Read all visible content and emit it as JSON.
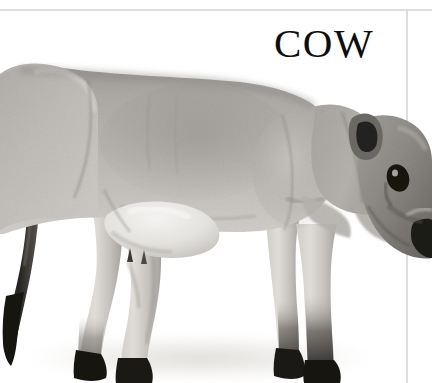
{
  "page": {
    "background_color": "#ffffff",
    "width": 432,
    "height": 383
  },
  "frame": {
    "rule_color": "#dedede",
    "top_rule_y": 9,
    "right_rule_x": 406
  },
  "caption": {
    "text": "COW",
    "color": "#0e0e0e",
    "align": "right"
  },
  "figure": {
    "subject": "cow",
    "alt_text": "COW",
    "style": "grayscale-photograph",
    "orientation": "profile-facing-right",
    "cropped_edges": [
      "left",
      "right",
      "bottom"
    ],
    "palette": {
      "coat_light": "#d8d6d2",
      "coat_mid": "#a9a6a1",
      "coat_shadow": "#7d7a76",
      "dark_markings": "#2a2826",
      "hoof_black": "#14120f",
      "ground_shadow": "#e6e5e3",
      "highlight": "#f2f1ef"
    },
    "parts": [
      "rump",
      "tail",
      "tail-switch",
      "topline",
      "barrel",
      "udder",
      "hind-legs",
      "fore-legs",
      "hooves",
      "shoulder",
      "neck",
      "head",
      "ear",
      "eye",
      "muzzle"
    ]
  }
}
